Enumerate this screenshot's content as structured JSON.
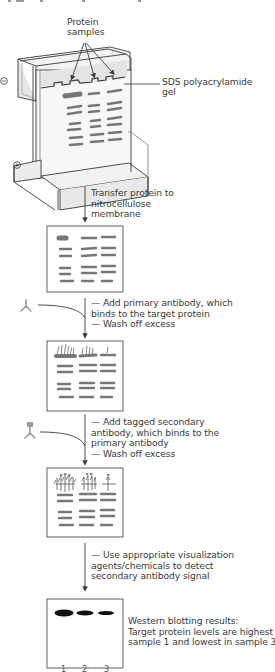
{
  "figure": {
    "cropped_top_caption_fragment": "",
    "gel_stage": {
      "samples_label": [
        "Protein",
        "samples"
      ],
      "gel_label": [
        "SDS polyacrylamide",
        "gel"
      ],
      "negative_electrode": "⊖",
      "positive_electrode": "⊕"
    },
    "steps": [
      {
        "id": "transfer",
        "lines": [
          "Transfer protein to",
          "nitrocellulose",
          "membrane"
        ]
      },
      {
        "id": "primary",
        "lines": [
          "— Add primary antibody, which",
          "binds to the target protein",
          "— Wash off excess"
        ],
        "icon": "primary-antibody-icon"
      },
      {
        "id": "secondary",
        "lines": [
          "— Add tagged secondary",
          "antibody, which binds to the",
          "primary antibody",
          "— Wash off excess"
        ],
        "icon": "tagged-secondary-antibody-icon"
      },
      {
        "id": "visualize",
        "lines": [
          "— Use appropriate visualization",
          "agents/chemicals to detect",
          "secondary antibody signal"
        ]
      }
    ],
    "result": {
      "lines": [
        "Western blotting results:",
        "Target protein levels are highest in",
        "sample 1 and lowest in sample 3"
      ],
      "lane_labels": [
        "1",
        "2",
        "3"
      ]
    },
    "colors": {
      "line": "#3a3a3a",
      "band": "#777777",
      "band_dark": "#111111",
      "apparatus_fill": "#eeeeee",
      "antibody": "#9a9a9a"
    }
  }
}
